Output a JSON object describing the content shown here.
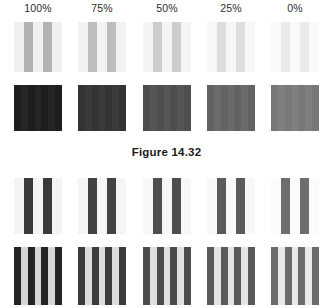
{
  "figure": {
    "caption": "Figure 14.32",
    "column_labels": [
      "100%",
      "75%",
      "50%",
      "25%",
      "0%"
    ],
    "column_count": 5,
    "row_count": 4
  },
  "layout": {
    "columns_x": [
      14,
      78,
      143,
      207,
      271
    ],
    "swatch_width": 48,
    "rows": [
      {
        "name": "row1",
        "top": 22,
        "height": 50
      },
      {
        "name": "row2",
        "top": 85,
        "height": 46
      },
      {
        "name": "row3",
        "top": 178,
        "height": 56
      },
      {
        "name": "row4",
        "top": 247,
        "height": 58
      }
    ]
  },
  "chart_data": {
    "type": "heatmap",
    "title": "Figure 14.32",
    "xlabel": "",
    "ylabel": "",
    "categories": [
      "100%",
      "75%",
      "50%",
      "25%",
      "0%"
    ],
    "grid": false,
    "legend": "none",
    "series": [
      {
        "name": "row1-light-background-gray-bars",
        "values": [
          100,
          75,
          50,
          25,
          0
        ],
        "background_colors": [
          "#f0f0f0",
          "#f2f2f2",
          "#f4f4f4",
          "#f7f7f7",
          "#fafafa"
        ],
        "stripe_colors": [
          "#b2b2b2",
          "#bdbdbd",
          "#cdcdcd",
          "#dedede",
          "#ebebeb"
        ],
        "stripe_count": 2
      },
      {
        "name": "row2-solid-dark-blocks",
        "values": [
          100,
          75,
          50,
          25,
          0
        ],
        "background_colors": [
          "#1d1d1d",
          "#333333",
          "#4e4e4e",
          "#636363",
          "#787878"
        ],
        "stripe_colors": [
          "#262626",
          "#3a3a3a",
          "#565656",
          "#6b6b6b",
          "#7f7f7f"
        ],
        "stripe_count": 3
      },
      {
        "name": "row3-white-background-dark-bars",
        "values": [
          100,
          75,
          50,
          25,
          0
        ],
        "background_colors": [
          "#f4f4f4",
          "#f5f5f5",
          "#f7f7f7",
          "#f8f8f8",
          "#fbfbfb"
        ],
        "stripe_colors": [
          "#3a3a3a",
          "#434343",
          "#4e4e4e",
          "#5b5b5b",
          "#6e6e6e"
        ],
        "stripe_count": 2
      },
      {
        "name": "row4-dark-background-light-stripes",
        "values": [
          100,
          75,
          50,
          25,
          0
        ],
        "background_colors": [
          "#242424",
          "#3b3b3b",
          "#4c4c4c",
          "#5a5a5a",
          "#6b6b6b"
        ],
        "stripe_colors": [
          "#d6d6d6",
          "#dcdcdc",
          "#e0e0e0",
          "#e4e4e4",
          "#eaeaea"
        ],
        "stripe_count": 3
      }
    ]
  }
}
